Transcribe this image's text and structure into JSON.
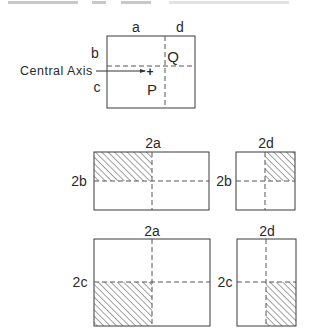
{
  "figure": {
    "top_diagram": {
      "labels": {
        "a": "a",
        "d": "d",
        "b": "b",
        "c": "c",
        "P": "P",
        "Q": "Q",
        "central_axis": "Central Axis",
        "plus": "+"
      }
    },
    "middle_left": {
      "width_label": "2a",
      "height_label": "2b",
      "hatched_quadrant": "top-left"
    },
    "middle_right": {
      "width_label": "2d",
      "height_label": "2b",
      "hatched_quadrant": "top-right"
    },
    "bottom_left": {
      "width_label": "2a",
      "height_label": "2c",
      "hatched_quadrant": "bottom-left"
    },
    "bottom_right": {
      "width_label": "2d",
      "height_label": "2c",
      "hatched_quadrant": "bottom-right"
    },
    "colors": {
      "line": "#3a3a3a",
      "dash": "#555555",
      "hatch": "#444444",
      "background": "#ffffff"
    }
  }
}
